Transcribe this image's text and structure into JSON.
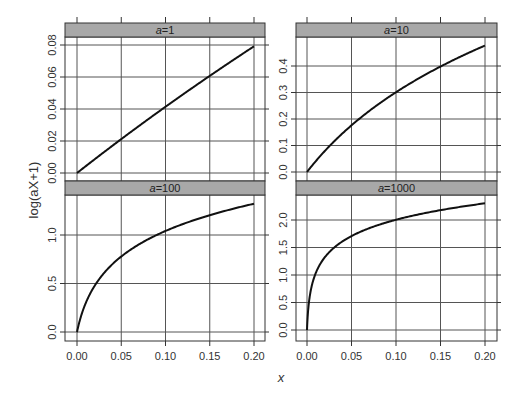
{
  "chart_data": {
    "type": "line",
    "title": "",
    "xlabel": "x",
    "ylabel": "log(aX+1)",
    "layout": "2x2 lattice panels",
    "grid": true,
    "x_ticks": [
      "0.00",
      "0.05",
      "0.10",
      "0.15",
      "0.20"
    ],
    "xlim": [
      0,
      0.2
    ],
    "panels": [
      {
        "strip": "a=1",
        "a": 1,
        "y_ticks": [
          "0.00",
          "0.02",
          "0.04",
          "0.06",
          "0.08"
        ],
        "ylim": [
          0,
          0.0823
        ],
        "x": [
          0,
          0.025,
          0.05,
          0.075,
          0.1,
          0.125,
          0.15,
          0.175,
          0.2
        ],
        "y": [
          0,
          0.0247,
          0.0488,
          0.0723,
          0.0953,
          0.1178,
          0.1398,
          0.1613,
          0.1823
        ]
      },
      {
        "strip": "a=10",
        "a": 10,
        "y_ticks": [
          "0.0",
          "0.1",
          "0.2",
          "0.3",
          "0.4"
        ],
        "ylim": [
          0,
          0.47
        ],
        "x": [
          0,
          0.025,
          0.05,
          0.075,
          0.1,
          0.125,
          0.15,
          0.175,
          0.2
        ],
        "y": [
          0,
          0.223,
          0.405,
          0.56,
          0.693,
          0.811,
          0.916,
          1.012,
          1.099
        ]
      },
      {
        "strip": "a=100",
        "a": 100,
        "y_ticks": [
          "0.0",
          "0.5",
          "1.0"
        ],
        "ylim": [
          0,
          1.3
        ],
        "x": [
          0,
          0.005,
          0.01,
          0.02,
          0.03,
          0.05,
          0.075,
          0.1,
          0.125,
          0.15,
          0.175,
          0.2
        ],
        "y": [
          0,
          0.405,
          0.693,
          1.099,
          1.386,
          1.792,
          2.14,
          2.398,
          2.603,
          2.773,
          2.918,
          3.045
        ]
      },
      {
        "strip": "a=1000",
        "a": 1000,
        "y_ticks": [
          "0.0",
          "0.5",
          "1.0",
          "1.5",
          "2.0"
        ],
        "ylim": [
          0,
          2.3
        ],
        "x": [
          0,
          0.001,
          0.002,
          0.005,
          0.01,
          0.02,
          0.05,
          0.1,
          0.15,
          0.2
        ],
        "y": [
          0,
          0.693,
          1.099,
          1.792,
          2.398,
          3.045,
          3.932,
          4.615,
          5.017,
          5.303
        ]
      }
    ],
    "note": "Curves plotted as log10(aX+1): a=1 → 0.079 at 0.2; a=10 → 0.477; a=100 → 1.322; a=1000 → 2.303"
  },
  "labels": {
    "ylabel": "log(aX+1)",
    "xlabel": "x"
  }
}
